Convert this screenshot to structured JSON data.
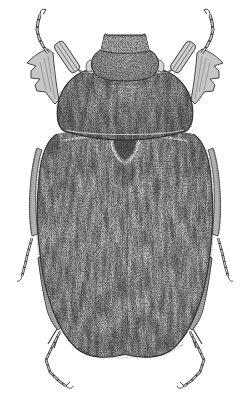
{
  "figure": {
    "style": "pen-and-ink stipple drawing on white background",
    "background_color": "#ffffff",
    "ink_color": "#2c2c2c",
    "midtone_color": "#9e9e9e",
    "shadow_color": "#565656",
    "highlight_color": "#eaeaea",
    "signature_note": "tiny illegible handwritten artist signature near lower-right edge of the elytra",
    "parts": [
      "head with upturned clypeus corners",
      "pale compound eyes",
      "lamellate antennal clubs",
      "pronotum",
      "dark scutellum with pale rim",
      "elytra with pale sutural stripe",
      "toothed front tibiae",
      "front tarsi curling upward with claws",
      "middle leg tarsi along elytra edges",
      "hind tibiae with long spurs",
      "hind tarsi with claws",
      "hairy fringes along body edges"
    ]
  }
}
